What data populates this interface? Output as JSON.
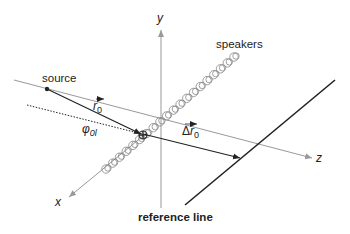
{
  "diagram": {
    "title": "",
    "labels": {
      "y_axis": "y",
      "z_axis": "z",
      "x_axis": "x",
      "speakers": "speakers",
      "source": "source",
      "r0": "r",
      "r0_sub": "0",
      "delta_r0_prefix": "Δ",
      "delta_r0": "r",
      "delta_r0_sub": "0",
      "phi0l": "φ",
      "phi0l_sub": "0l",
      "reference_line": "reference line"
    },
    "colors": {
      "axis": "#999999",
      "line": "#222222",
      "speaker": "#888888",
      "text": "#222222"
    },
    "speaker_count": 20
  }
}
